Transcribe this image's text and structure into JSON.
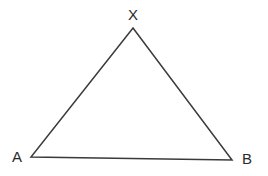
{
  "figure": {
    "type": "geometry-diagram",
    "shape": "triangle",
    "background_color": "#ffffff",
    "stroke_color": "#3a3a3a",
    "stroke_width": 1.5,
    "label_color": "#2b2b2b",
    "canvas": {
      "width": 268,
      "height": 176
    },
    "vertices": [
      {
        "id": "X",
        "label": "X",
        "x": 133,
        "y": 28,
        "label_x": 133,
        "label_y": 14,
        "label_position": "above"
      },
      {
        "id": "A",
        "label": "A",
        "x": 31,
        "y": 157,
        "label_x": 17,
        "label_y": 156,
        "label_position": "left"
      },
      {
        "id": "B",
        "label": "B",
        "x": 232,
        "y": 160,
        "label_x": 247,
        "label_y": 158,
        "label_position": "right"
      }
    ],
    "edges": [
      {
        "id": "AX",
        "from": "A",
        "to": "X"
      },
      {
        "id": "XB",
        "from": "X",
        "to": "B"
      },
      {
        "id": "AB",
        "from": "A",
        "to": "B"
      }
    ]
  }
}
